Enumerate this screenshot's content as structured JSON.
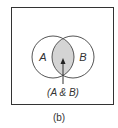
{
  "diagram": {
    "type": "venn",
    "sets": [
      {
        "label": "A"
      },
      {
        "label": "B"
      }
    ],
    "intersection": {
      "label": "(A & B)",
      "fill": "#d4d4d4"
    },
    "stroke_color": "#444444",
    "caption": "(b)"
  }
}
